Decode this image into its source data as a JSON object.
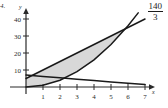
{
  "figure": {
    "problem_label": "4.",
    "answer_value": "140",
    "answer_denominator": "3",
    "axis_x_label": "x",
    "axis_y_label": "y",
    "ink_color": "#1a1a1a",
    "shade_color": "#d8d8d8"
  },
  "chart_data": {
    "type": "line",
    "title": "",
    "xlabel": "x",
    "ylabel": "y",
    "xlim": [
      -0.4,
      7.6
    ],
    "ylim": [
      -2.5,
      46
    ],
    "grid": false,
    "legend": false,
    "xticks": [
      1,
      2,
      3,
      4,
      5,
      6,
      7
    ],
    "xtick_labels": [
      "1",
      "2",
      "3",
      "4",
      "5",
      "6",
      "7"
    ],
    "yticks": [
      10,
      20,
      30,
      40
    ],
    "ytick_labels": [
      "10",
      "20",
      "30",
      "40"
    ],
    "shaded_region": {
      "between": [
        "upper line",
        "parabola"
      ],
      "x_from": 0,
      "x_to": 6,
      "fill": "#d8d8d8",
      "area_label": "140/3"
    },
    "series": [
      {
        "name": "upper line",
        "type": "line",
        "equation": "y = 5 + 5x",
        "x": [
          0,
          1,
          2,
          3,
          4,
          5,
          6,
          7
        ],
        "values": [
          5,
          10,
          15,
          20,
          25,
          30,
          35,
          40
        ]
      },
      {
        "name": "parabola",
        "type": "line",
        "equation": "y = x^2",
        "x": [
          0,
          1,
          2,
          3,
          4,
          5,
          6,
          6.6
        ],
        "values": [
          0,
          1,
          4,
          9,
          16,
          25,
          36,
          43.6
        ]
      },
      {
        "name": "lower line",
        "type": "line",
        "equation": "y = 7 - 0.8x",
        "x": [
          0,
          1,
          2,
          3,
          4,
          5,
          6,
          7
        ],
        "values": [
          7,
          6.2,
          5.4,
          4.6,
          3.8,
          3,
          2.2,
          1.4
        ]
      }
    ],
    "annotations": [
      {
        "text": "140",
        "role": "answer-numerator"
      },
      {
        "text": "3",
        "role": "answer-denominator"
      },
      {
        "text": "4.",
        "role": "problem-number"
      }
    ]
  }
}
